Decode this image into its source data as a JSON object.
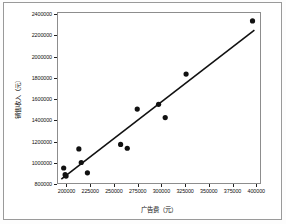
{
  "chart_data": {
    "type": "scatter",
    "title": "",
    "xlabel": "广告费（元）",
    "ylabel": "销售收入（元）",
    "xlim": [
      190000,
      405000
    ],
    "ylim": [
      800000,
      2420000
    ],
    "grid": false,
    "legend": "none",
    "x_ticks": [
      200000,
      225000,
      250000,
      275000,
      300000,
      325000,
      350000,
      375000,
      400000
    ],
    "x_tick_labels": [
      "200000",
      "225000",
      "250000",
      "275000",
      "300000",
      "325000",
      "350000",
      "375000",
      "400000"
    ],
    "y_ticks": [
      800000,
      1000000,
      1200000,
      1400000,
      1600000,
      1800000,
      2000000,
      2200000,
      2400000
    ],
    "y_tick_labels": [
      "800000",
      "1000000",
      "1200000",
      "1400000",
      "1600000",
      "1800000",
      "2000000",
      "2200000",
      "2400000"
    ],
    "series": [
      {
        "name": "观测值",
        "marker": "filled-circle",
        "color": "#111111",
        "points": [
          {
            "x": 196000,
            "y": 960000
          },
          {
            "x": 197500,
            "y": 897000
          },
          {
            "x": 198500,
            "y": 884000
          },
          {
            "x": 212000,
            "y": 1140000
          },
          {
            "x": 214500,
            "y": 1012000
          },
          {
            "x": 221000,
            "y": 915000
          },
          {
            "x": 256000,
            "y": 1182000
          },
          {
            "x": 263000,
            "y": 1146000
          },
          {
            "x": 273500,
            "y": 1515000
          },
          {
            "x": 296000,
            "y": 1560000
          },
          {
            "x": 303000,
            "y": 1435000
          },
          {
            "x": 325000,
            "y": 1845000
          },
          {
            "x": 395000,
            "y": 2345000
          }
        ]
      }
    ],
    "fit_line": {
      "name": "拟合直线",
      "color": "#111111",
      "x_start": 193500,
      "y_start": 855000,
      "x_end": 397000,
      "y_end": 2258000
    }
  }
}
